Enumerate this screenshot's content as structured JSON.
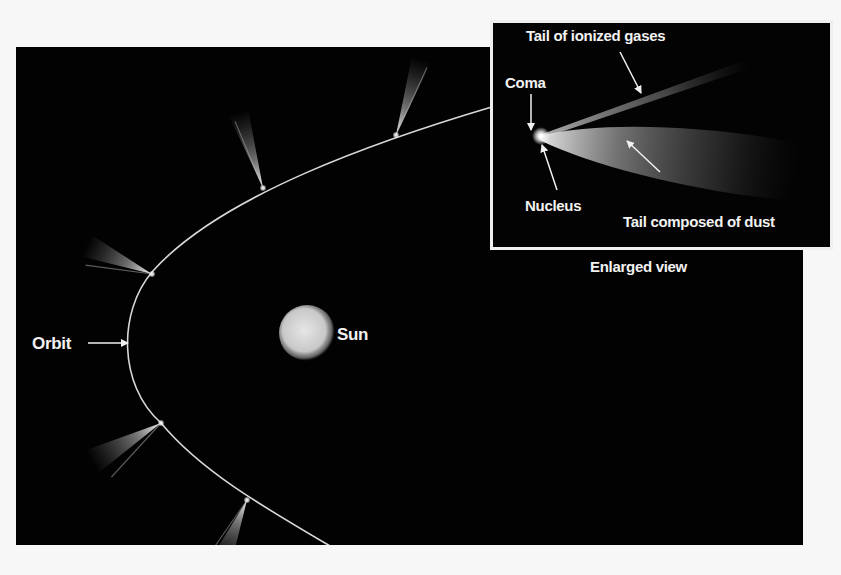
{
  "diagram": {
    "main_view": {
      "labels": {
        "orbit": "Orbit",
        "sun": "Sun"
      },
      "comet_positions": [
        {
          "id": "comet-1",
          "head": [
            152,
            274
          ],
          "tail_to": [
            88,
            244
          ]
        },
        {
          "id": "comet-2",
          "head": [
            263,
            188
          ],
          "tail_to": [
            238,
            112
          ]
        },
        {
          "id": "comet-3",
          "head": [
            396,
            135
          ],
          "tail_to": [
            428,
            60
          ]
        },
        {
          "id": "comet-4",
          "head": [
            161,
            423
          ],
          "tail_to": [
            92,
            465
          ]
        },
        {
          "id": "comet-5",
          "head": [
            247,
            500
          ],
          "tail_to": [
            222,
            560
          ]
        }
      ]
    },
    "enlarged_view": {
      "caption": "Enlarged view",
      "labels": {
        "ion_tail": "Tail of ionized gases",
        "coma": "Coma",
        "nucleus": "Nucleus",
        "dust_tail": "Tail composed of dust"
      }
    },
    "colors": {
      "background": "#020202",
      "page": "#f7f7f7",
      "orbit_line": "#d8d8d8",
      "text": "#f2f2f2"
    }
  }
}
